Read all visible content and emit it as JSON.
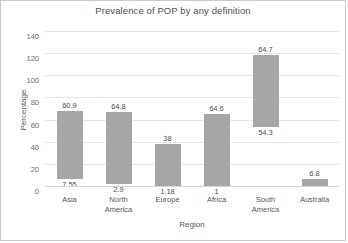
{
  "chart_data": {
    "type": "bar",
    "title": "Prevalence of POP by any definition",
    "xlabel": "Region",
    "ylabel": "Percentage",
    "ylim": [
      0,
      140
    ],
    "ytick_labels": [
      "0",
      "20",
      "40",
      "60",
      "80",
      "100",
      "120",
      "140"
    ],
    "yticks": [
      0,
      20,
      40,
      60,
      80,
      100,
      120,
      140
    ],
    "grid": true,
    "legend": "none",
    "categories": [
      "Asia",
      "North America",
      "Europe",
      "Africa",
      "South America",
      "Australia"
    ],
    "series": [
      {
        "name": "lower",
        "values": [
          7.55,
          2.9,
          1.18,
          1,
          54.3,
          0
        ]
      },
      {
        "name": "upper",
        "values": [
          60.9,
          64.8,
          38,
          64.6,
          64.7,
          6.8
        ]
      }
    ],
    "bars": [
      {
        "category": "Asia",
        "category_lines": [
          "Asia"
        ],
        "bottom_label": "7.55",
        "top_label": "60.9",
        "bar_bottom_value": 7.55,
        "bar_top_value": 68.45
      },
      {
        "category": "North America",
        "category_lines": [
          "North",
          "America"
        ],
        "bottom_label": "2.9",
        "top_label": "64.8",
        "bar_bottom_value": 2.9,
        "bar_top_value": 67.7
      },
      {
        "category": "Europe",
        "category_lines": [
          "Europe"
        ],
        "bottom_label": "1.18",
        "top_label": "38",
        "bar_bottom_value": 1.18,
        "bar_top_value": 39.18
      },
      {
        "category": "Africa",
        "category_lines": [
          "Africa"
        ],
        "bottom_label": "1",
        "top_label": "64.6",
        "bar_bottom_value": 1,
        "bar_top_value": 65.6
      },
      {
        "category": "South America",
        "category_lines": [
          "South",
          "America"
        ],
        "bottom_label": "54.3",
        "top_label": "64.7",
        "bar_bottom_value": 54.3,
        "bar_top_value": 119.0
      },
      {
        "category": "Australia",
        "category_lines": [
          "Australia"
        ],
        "bottom_label": "",
        "top_label": "6.8",
        "bar_bottom_value": 0,
        "bar_top_value": 6.8
      }
    ],
    "colors": {
      "bar_fill": "#a6a6a6",
      "gridline": "#e4e5e7",
      "text": "#58595b",
      "background": "#ffffff",
      "border": "#c9cacc"
    }
  }
}
